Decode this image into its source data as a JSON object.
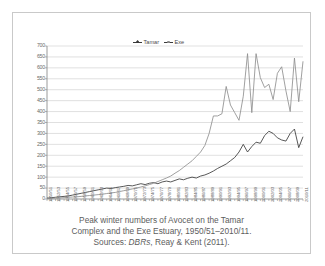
{
  "figure": {
    "caption_line1": "Peak winter numbers of Avocet on the Tamar",
    "caption_line2": "Complex and the Exe Estuary, 1950/51–2010/11.",
    "caption_source_prefix": "Sources: ",
    "caption_source_italic": "DBRs",
    "caption_source_rest": ", Reay & Kent (2011)."
  },
  "legend": {
    "position": "top-center",
    "items": [
      {
        "label": "Tamar",
        "color": "#3a3a3a",
        "marker": "diamond"
      },
      {
        "label": "Exe",
        "color": "#8a8a8a",
        "marker": "circle"
      }
    ]
  },
  "colors": {
    "tamar": "#3a3a3a",
    "exe": "#8f8f8f",
    "grid": "#c0c0c0",
    "axis": "#808080",
    "text": "#6b6b6b",
    "frame": "#c9c9c9"
  },
  "chart_data": {
    "type": "line",
    "title": "",
    "xlabel": "",
    "ylabel": "",
    "ylim": [
      0,
      700
    ],
    "ytick_step": 50,
    "yticks": [
      0,
      50,
      100,
      150,
      200,
      250,
      300,
      350,
      400,
      450,
      500,
      550,
      600,
      650,
      700
    ],
    "grid": true,
    "xtick_every": 2,
    "categories": [
      "1950/51",
      "1951/52",
      "1952/53",
      "1953/54",
      "1954/55",
      "1955/56",
      "1956/57",
      "1957/58",
      "1958/59",
      "1959/60",
      "1960/61",
      "1961/62",
      "1962/63",
      "1963/64",
      "1964/65",
      "1965/66",
      "1966/67",
      "1967/68",
      "1968/69",
      "1969/70",
      "1970/71",
      "1971/72",
      "1972/73",
      "1973/74",
      "1974/75",
      "1975/76",
      "1976/77",
      "1977/78",
      "1978/79",
      "1979/80",
      "1980/81",
      "1981/82",
      "1982/83",
      "1983/84",
      "1984/85",
      "1985/86",
      "1986/87",
      "1987/88",
      "1988/89",
      "1989/90",
      "1990/91",
      "1991/92",
      "1992/93",
      "1993/94",
      "1994/95",
      "1995/96",
      "1996/97",
      "1997/98",
      "1998/99",
      "1999/00",
      "2000/01",
      "2001/02",
      "2002/03",
      "2003/04",
      "2004/05",
      "2005/06",
      "2006/07",
      "2007/08",
      "2008/09",
      "2009/10",
      "2010/11"
    ],
    "xtick_labels": [
      "1950/51",
      "1952/53",
      "1954/55",
      "1956/57",
      "1958/59",
      "1960/61",
      "1962/63",
      "1964/65",
      "1966/67",
      "1968/69",
      "1970/71",
      "1972/73",
      "1974/75",
      "1976/77",
      "1978/79",
      "1980/81",
      "1982/83",
      "1984/85",
      "1986/87",
      "1988/89",
      "1990/91",
      "1992/93",
      "1994/95",
      "1996/97",
      "1998/99",
      "2000/01",
      "2002/03",
      "2004/05",
      "2006/07",
      "2008/09",
      "2010/11"
    ],
    "series": [
      {
        "name": "Tamar",
        "color": "#3a3a3a",
        "values": [
          4,
          6,
          8,
          10,
          12,
          14,
          18,
          22,
          26,
          30,
          34,
          38,
          42,
          46,
          50,
          48,
          52,
          55,
          58,
          62,
          60,
          65,
          70,
          66,
          72,
          75,
          70,
          78,
          82,
          78,
          85,
          92,
          88,
          95,
          100,
          96,
          105,
          110,
          118,
          128,
          140,
          150,
          160,
          175,
          190,
          215,
          250,
          215,
          240,
          260,
          255,
          290,
          310,
          300,
          280,
          270,
          265,
          300,
          320,
          235,
          285
        ]
      },
      {
        "name": "Exe",
        "color": "#8f8f8f",
        "values": [
          2,
          3,
          4,
          5,
          6,
          8,
          9,
          10,
          12,
          14,
          16,
          18,
          20,
          22,
          25,
          28,
          30,
          34,
          38,
          42,
          46,
          50,
          55,
          60,
          66,
          72,
          80,
          88,
          96,
          105,
          118,
          130,
          145,
          160,
          175,
          195,
          215,
          245,
          300,
          380,
          380,
          390,
          515,
          430,
          395,
          360,
          470,
          665,
          395,
          665,
          555,
          510,
          525,
          455,
          575,
          605,
          495,
          400,
          645,
          445,
          630
        ]
      }
    ]
  }
}
